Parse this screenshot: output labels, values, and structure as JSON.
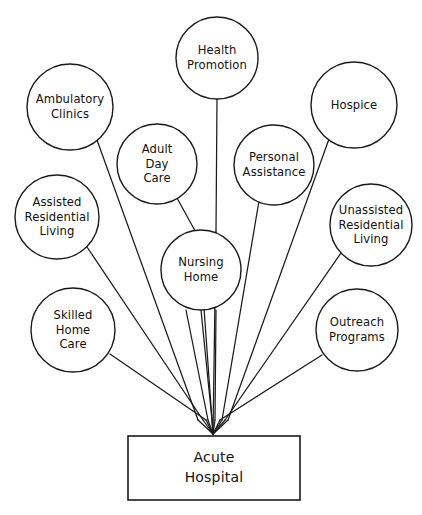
{
  "diagram": {
    "type": "hub-and-spoke",
    "background_color": "#ffffff",
    "line_color": "#1a1a1a",
    "text_color": "#111111",
    "hub": {
      "id": "acute-hospital",
      "shape": "rectangle",
      "lines": [
        "Acute",
        "Hospital"
      ],
      "x": 128,
      "y": 436,
      "width": 172,
      "height": 64
    },
    "convergence_point": {
      "x": 213,
      "y": 434
    },
    "nodes": [
      {
        "id": "health-promotion",
        "lines": [
          "Health",
          "Promotion"
        ],
        "cx": 217,
        "cy": 58,
        "r": 41,
        "edge": {
          "kind": "straight",
          "from": {
            "x": 217,
            "y": 99
          },
          "to": {
            "x": 216,
            "y": 231
          }
        }
      },
      {
        "id": "ambulatory-clinics",
        "lines": [
          "Ambulatory",
          "Clinics"
        ],
        "cx": 70,
        "cy": 107,
        "r": 43,
        "edge": {
          "kind": "straight",
          "from": {
            "x": 97,
            "y": 140
          },
          "to": {
            "x": 198,
            "y": 420
          }
        }
      },
      {
        "id": "hospice",
        "lines": [
          "Hospice"
        ],
        "cx": 354,
        "cy": 105,
        "r": 43,
        "edge": {
          "kind": "straight",
          "from": {
            "x": 329,
            "y": 139
          },
          "to": {
            "x": 228,
            "y": 420
          }
        }
      },
      {
        "id": "adult-day-care",
        "lines": [
          "Adult",
          "Day",
          "Care"
        ],
        "cx": 157,
        "cy": 164,
        "r": 40,
        "edge": {
          "kind": "straight",
          "from": {
            "x": 177,
            "y": 198
          },
          "to": {
            "x": 199,
            "y": 238
          }
        }
      },
      {
        "id": "personal-assistance",
        "lines": [
          "Personal",
          "Assistance"
        ],
        "cx": 274,
        "cy": 165,
        "r": 40,
        "edge": {
          "kind": "straight",
          "from": {
            "x": 259,
            "y": 201
          },
          "to": {
            "x": 222,
            "y": 420
          }
        }
      },
      {
        "id": "assisted-residential-living",
        "lines": [
          "Assisted",
          "Residential",
          "Living"
        ],
        "cx": 57,
        "cy": 217,
        "r": 42,
        "edge": {
          "kind": "straight",
          "from": {
            "x": 87,
            "y": 247
          },
          "to": {
            "x": 203,
            "y": 420
          }
        }
      },
      {
        "id": "unassisted-residential-living",
        "lines": [
          "Unassisted",
          "Residential",
          "Living"
        ],
        "cx": 371,
        "cy": 225,
        "r": 41,
        "edge": {
          "kind": "straight",
          "from": {
            "x": 341,
            "y": 253
          },
          "to": {
            "x": 225,
            "y": 420
          }
        }
      },
      {
        "id": "nursing-home",
        "lines": [
          "Nursing",
          "Home"
        ],
        "cx": 201,
        "cy": 270,
        "r": 40,
        "edge": {
          "kind": "straight",
          "from": {
            "x": 201,
            "y": 310
          },
          "to": {
            "x": 212,
            "y": 420
          }
        }
      },
      {
        "id": "skilled-home-care",
        "lines": [
          "Skilled",
          "Home",
          "Care"
        ],
        "cx": 73,
        "cy": 330,
        "r": 42,
        "edge": {
          "kind": "straight",
          "from": {
            "x": 110,
            "y": 354
          },
          "to": {
            "x": 206,
            "y": 420
          }
        }
      },
      {
        "id": "outreach-programs",
        "lines": [
          "Outreach",
          "Programs"
        ],
        "cx": 357,
        "cy": 330,
        "r": 41,
        "edge": {
          "kind": "straight",
          "from": {
            "x": 322,
            "y": 355
          },
          "to": {
            "x": 220,
            "y": 420
          }
        }
      }
    ],
    "extra_edges": [
      {
        "id": "adult-day-care-through-hub",
        "from": {
          "x": 186,
          "y": 310
        },
        "to": {
          "x": 208,
          "y": 420
        }
      },
      {
        "id": "health-promotion-through-hub",
        "from": {
          "x": 216,
          "y": 310
        },
        "to": {
          "x": 215,
          "y": 420
        }
      }
    ]
  }
}
